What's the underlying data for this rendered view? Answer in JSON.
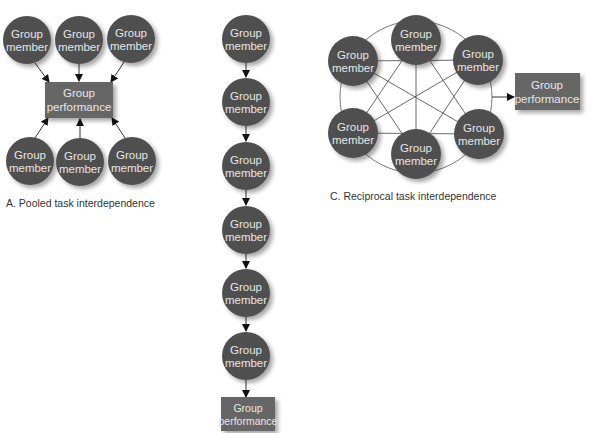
{
  "colors": {
    "node_fill": "#4f4f4f",
    "node_text": "#e6e6e6",
    "box_fill": "#666666",
    "line": "#333333",
    "caption": "#333333"
  },
  "labels": {
    "member_line1": "Group",
    "member_line2": "member",
    "performance_line1": "Group",
    "performance_line2": "performance"
  },
  "diagrams": {
    "pooled": {
      "caption": "A. Pooled task interdependence",
      "members_count": 6,
      "arrows": "each member → group performance"
    },
    "sequential": {
      "caption": "",
      "members_count": 6,
      "arrows": "chain member → member → group performance"
    },
    "reciprocal": {
      "caption": "C. Reciprocal task interdependence",
      "members_count": 6,
      "arrows": "all members interconnected → group performance"
    }
  }
}
